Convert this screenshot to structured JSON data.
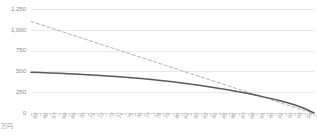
{
  "chart_data": {
    "type": "line",
    "title": "",
    "subtitle": "",
    "xlabel": "",
    "ylabel": "",
    "unit_label": "万円",
    "grid": true,
    "legend": "none",
    "ylim": [
      0,
      1250
    ],
    "yticks": [
      1250,
      1000,
      750,
      500,
      250,
      0
    ],
    "ytick_labels": [
      "1,250",
      "1,000",
      "750",
      "500",
      "250",
      "0"
    ],
    "categories": [
      65,
      66,
      67,
      68,
      69,
      70,
      71,
      72,
      73,
      74,
      75,
      76,
      77,
      78,
      79,
      80,
      81,
      82,
      83,
      84,
      85,
      86,
      87,
      88,
      89,
      90,
      91,
      92,
      93,
      94,
      95
    ],
    "xtick_labels": [
      "65",
      "66",
      "67",
      "68",
      "69",
      "70",
      "71",
      "72",
      "73",
      "74",
      "75",
      "76",
      "77",
      "78",
      "79",
      "80",
      "81",
      "82",
      "83",
      "84",
      "85",
      "86",
      "87",
      "88",
      "89",
      "90",
      "91",
      "92",
      "93",
      "94",
      "95"
    ],
    "series": [
      {
        "name": "series-dashed",
        "style": "dashed",
        "color": "#b0b0b0",
        "values": [
          1100,
          1063,
          1026,
          989,
          952,
          915,
          878,
          841,
          804,
          767,
          730,
          693,
          656,
          619,
          582,
          545,
          508,
          471,
          434,
          397,
          360,
          323,
          286,
          249,
          212,
          175,
          138,
          101,
          64,
          30,
          0
        ]
      },
      {
        "name": "series-solid",
        "style": "solid",
        "color": "#595959",
        "values": [
          490,
          486,
          482,
          477,
          472,
          466,
          460,
          453,
          446,
          438,
          430,
          421,
          411,
          400,
          388,
          375,
          361,
          346,
          330,
          313,
          295,
          276,
          255,
          233,
          210,
          185,
          158,
          129,
          97,
          54,
          0
        ]
      }
    ]
  }
}
